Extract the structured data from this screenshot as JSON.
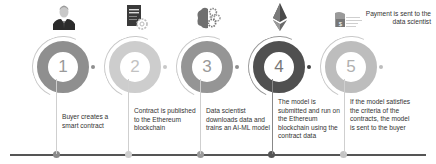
{
  "colors": {
    "ring_dark": "#555555",
    "ring_mid": "#8f8f8f",
    "ring_light": "#c4c4c4",
    "timeline": "#555555",
    "text": "#333333",
    "number": "#9a9a9a"
  },
  "steps": [
    {
      "number": "1",
      "icon": "businessman-icon",
      "description": "Buyer creates a smart contract"
    },
    {
      "number": "2",
      "icon": "contract-document-gear-icon",
      "description": "Contract is published to the Ethereum blockchain"
    },
    {
      "number": "3",
      "icon": "brain-gears-icon",
      "description": "Data scientist downloads data and trains an AI-ML model"
    },
    {
      "number": "4",
      "icon": "ethereum-icon",
      "description": "The model is submitted and run on the Ethereum blockchain using the contract data"
    },
    {
      "number": "5",
      "icon": "dollar-payment-icon",
      "description": "If the model satisfies the criteria of the contracts, the model is sent to the buyer"
    }
  ],
  "payment_note": "Payment is sent to the data scientist"
}
